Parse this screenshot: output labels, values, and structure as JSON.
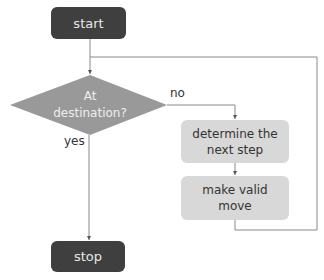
{
  "diagram": {
    "type": "flowchart",
    "nodes": {
      "start": {
        "label": "start",
        "shape": "rounded-rectangle",
        "fill": "#3f3f3f"
      },
      "decision": {
        "label_line1": "At",
        "label_line2": "destination?",
        "shape": "diamond",
        "fill": "#999999"
      },
      "determine": {
        "label_line1": "determine the",
        "label_line2": "next step",
        "shape": "rounded-rectangle",
        "fill": "#d8d8d8"
      },
      "move": {
        "label_line1": "make valid",
        "label_line2": "move",
        "shape": "rounded-rectangle",
        "fill": "#d8d8d8"
      },
      "stop": {
        "label": "stop",
        "shape": "rounded-rectangle",
        "fill": "#3f3f3f"
      }
    },
    "edges": [
      {
        "from": "start",
        "to": "decision",
        "label": ""
      },
      {
        "from": "decision",
        "to": "determine",
        "label": "no"
      },
      {
        "from": "decision",
        "to": "stop",
        "label": "yes"
      },
      {
        "from": "determine",
        "to": "move",
        "label": ""
      },
      {
        "from": "move",
        "to": "decision",
        "label": ""
      }
    ],
    "edge_labels": {
      "no": "no",
      "yes": "yes"
    },
    "colors": {
      "line": "#8a8a8a",
      "terminal": "#3f3f3f",
      "decision": "#999999",
      "process": "#d8d8d8"
    }
  }
}
